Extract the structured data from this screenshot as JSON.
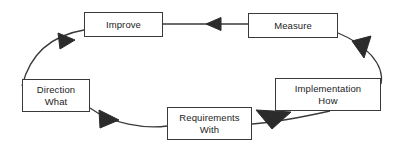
{
  "diagram": {
    "type": "closed-loop-cycle",
    "direction": "counter-clockwise",
    "background_color": "#ffffff",
    "line_color": "#3a3a3a",
    "arrow_color": "#2b2b2b",
    "text_color": "#1c1c1c",
    "nodes": [
      {
        "id": "improve",
        "line1": "Improve",
        "line2": "",
        "x": 84,
        "y": 12,
        "w": 79,
        "h": 25
      },
      {
        "id": "measure",
        "line1": "Measure",
        "line2": "",
        "x": 248,
        "y": 13,
        "w": 90,
        "h": 25
      },
      {
        "id": "implementation",
        "line1": "Implementation",
        "line2": "How",
        "x": 275,
        "y": 78,
        "w": 106,
        "h": 33
      },
      {
        "id": "requirements",
        "line1": "Requirements",
        "line2": "With",
        "x": 167,
        "y": 107,
        "w": 85,
        "h": 33
      },
      {
        "id": "direction",
        "line1": "Direction",
        "line2": "What",
        "x": 22,
        "y": 79,
        "w": 68,
        "h": 33
      }
    ],
    "edges": [
      {
        "id": "measure-to-improve",
        "from": "measure",
        "to": "improve",
        "label": ""
      },
      {
        "id": "improve-to-direction",
        "from": "improve",
        "to": "direction",
        "label": ""
      },
      {
        "id": "direction-to-requirements",
        "from": "direction",
        "to": "requirements",
        "label": ""
      },
      {
        "id": "requirements-to-implementation",
        "from": "requirements",
        "to": "implementation",
        "label": ""
      },
      {
        "id": "implementation-to-measure",
        "from": "implementation",
        "to": "measure",
        "label": ""
      }
    ]
  }
}
